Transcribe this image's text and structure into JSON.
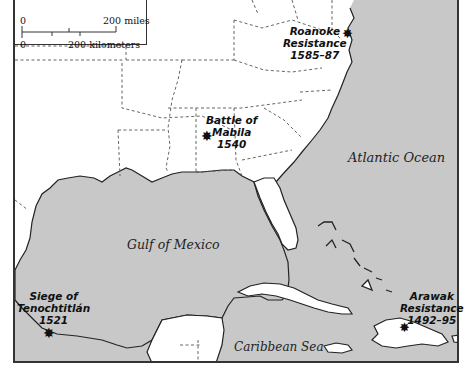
{
  "scale": {
    "miles_zero": "0",
    "miles_label": "200 miles",
    "km_zero": "0",
    "km_label": "200 kilometers"
  },
  "water_bodies": {
    "atlantic": "Atlantic Ocean",
    "gulf": "Gulf of Mexico",
    "caribbean": "Caribbean Sea"
  },
  "events": [
    {
      "name": "Roanoke",
      "name2": "Resistance",
      "date": "1585–87"
    },
    {
      "name": "Battle of",
      "name2": "Mabila",
      "date": "1540"
    },
    {
      "name": "Siege of",
      "name2": "Tenochtitlán",
      "date": "1521"
    },
    {
      "name": "Arawak",
      "name2": "Resistance",
      "date": "1492–95"
    }
  ],
  "colors": {
    "water": "#c8c8c8",
    "land": "#ffffff",
    "border": "#333333",
    "marker": "#111111"
  }
}
